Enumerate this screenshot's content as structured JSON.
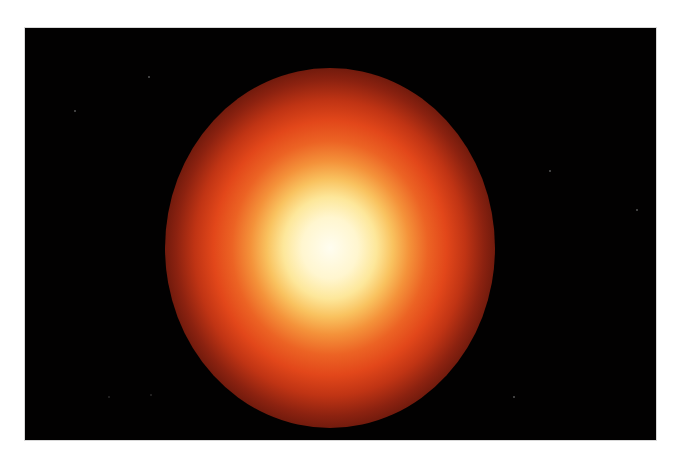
{
  "page": {
    "background_color": "#ffffff",
    "top_text_fragment": {
      "visible": "cropped descenders only",
      "descender_x_positions": [
        73,
        173,
        326
      ]
    }
  },
  "figure": {
    "kind": "astronomical image",
    "frame": {
      "x": 25,
      "y": 28,
      "width": 631,
      "height": 412,
      "background": "#020101"
    },
    "star": {
      "center": {
        "x": 330,
        "y": 248
      },
      "radius_x": 160,
      "radius_y": 175,
      "color_stops": [
        "#fffdf0",
        "#fde79a",
        "#f4923a",
        "#e2471a",
        "#8c2210",
        "#2e0905",
        "#020101"
      ]
    },
    "specks": [
      {
        "x": 74,
        "y": 110
      },
      {
        "x": 148,
        "y": 76
      },
      {
        "x": 549,
        "y": 170
      },
      {
        "x": 636,
        "y": 209
      },
      {
        "x": 513,
        "y": 396
      },
      {
        "x": 108,
        "y": 396
      },
      {
        "x": 150,
        "y": 394
      }
    ]
  }
}
